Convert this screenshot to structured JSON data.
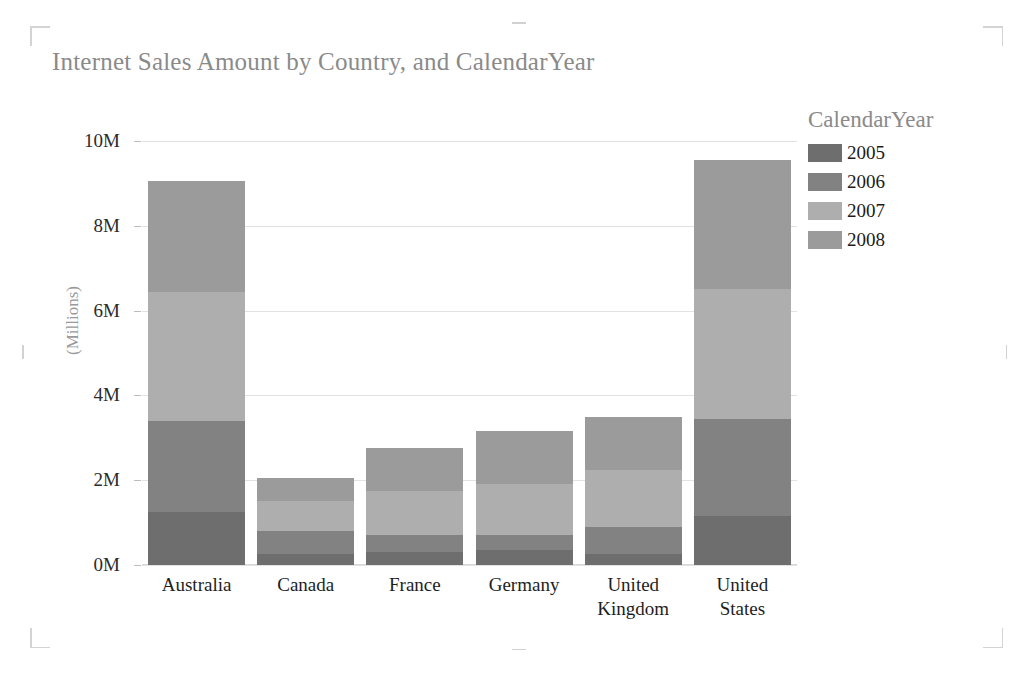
{
  "chart_data": {
    "type": "bar",
    "subtype": "stacked-bar",
    "title": "Internet Sales Amount by Country, and CalendarYear",
    "xlabel": "",
    "ylabel": "(Millions)",
    "categories": [
      "Australia",
      "Canada",
      "France",
      "Germany",
      "United Kingdom",
      "United States"
    ],
    "category_lines": [
      [
        "Australia"
      ],
      [
        "Canada"
      ],
      [
        "France"
      ],
      [
        "Germany"
      ],
      [
        "United",
        "Kingdom"
      ],
      [
        "United",
        "States"
      ]
    ],
    "series": [
      {
        "name": "2005",
        "color": "#6e6e6e",
        "values": [
          1.25,
          0.25,
          0.3,
          0.35,
          0.25,
          1.15
        ]
      },
      {
        "name": "2006",
        "color": "#828282",
        "values": [
          2.15,
          0.55,
          0.4,
          0.35,
          0.65,
          2.3
        ]
      },
      {
        "name": "2007",
        "color": "#aeaeae",
        "values": [
          3.05,
          0.7,
          1.05,
          1.2,
          1.35,
          3.05
        ]
      },
      {
        "name": "2008",
        "color": "#9b9b9b",
        "values": [
          2.6,
          0.55,
          1.0,
          1.25,
          1.25,
          3.05
        ]
      }
    ],
    "totals": [
      9.05,
      2.05,
      2.75,
      3.15,
      3.5,
      9.55
    ],
    "ylim": [
      0,
      10
    ],
    "yticks": [
      0,
      2,
      4,
      6,
      8,
      10
    ],
    "ytick_labels": [
      "0M",
      "2M",
      "4M",
      "6M",
      "8M",
      "10M"
    ],
    "grid": true,
    "legend": {
      "title": "CalendarYear",
      "position": "right",
      "entries": [
        {
          "label": "2005",
          "color": "#6e6e6e"
        },
        {
          "label": "2006",
          "color": "#828282"
        },
        {
          "label": "2007",
          "color": "#aeaeae"
        },
        {
          "label": "2008",
          "color": "#9b9b9b"
        }
      ]
    }
  },
  "colors": {
    "title": "#8a8a8a",
    "axis_text": "#2c2c2c",
    "axis_title": "#9a9a9a",
    "gridline": "#e2e2e2",
    "background": "#ffffff"
  }
}
